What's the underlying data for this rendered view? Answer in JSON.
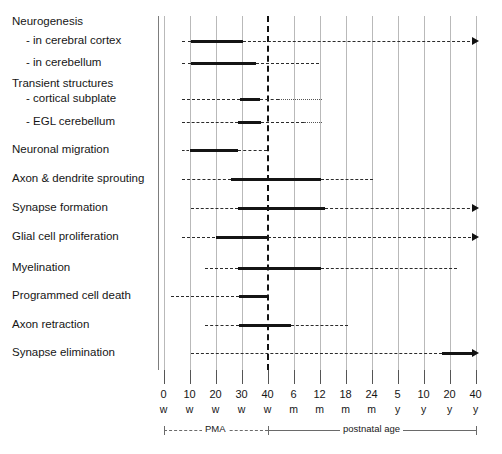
{
  "chart_data": {
    "type": "timeline",
    "title": "",
    "xlabel": "",
    "ylabel": "",
    "grid": true,
    "legend": null,
    "x_tick_numbers": [
      "0",
      "10",
      "20",
      "30",
      "40",
      "6",
      "12",
      "18",
      "24",
      "5",
      "10",
      "20",
      "40"
    ],
    "x_tick_units": [
      "w",
      "w",
      "w",
      "w",
      "w",
      "m",
      "m",
      "m",
      "m",
      "y",
      "y",
      "y",
      "y"
    ],
    "x_index_range": [
      0,
      12
    ],
    "axis_ranges": [
      {
        "label": "PMA",
        "from_index": 0,
        "to_index": 4,
        "style": "dashed"
      },
      {
        "label": "postnatal age",
        "from_index": 4,
        "to_index": 12,
        "style": "solid"
      }
    ],
    "birth_marker_index": 4,
    "categories": [
      "Neurogenesis",
      " -  in cerebral cortex",
      " -   in cerebellum",
      "Transient structures",
      " -  cortical subplate",
      " -  EGL cerebellum",
      "Neuronal migration",
      "Axon & dendrite sprouting",
      "Synapse formation",
      "Glial cell proliferation",
      "Myelination",
      "Programmed cell death",
      "Axon retraction",
      "Synapse elimination"
    ],
    "rows": [
      {
        "label": "Neurogenesis",
        "header": true,
        "segments": []
      },
      {
        "label": " -  in cerebral cortex",
        "header": false,
        "segments": [
          {
            "kind": "dashed",
            "start": 0.72,
            "end": 1.05
          },
          {
            "kind": "solid",
            "start": 1.05,
            "end": 3.05
          },
          {
            "kind": "dashed",
            "start": 3.05,
            "end": 12.0
          }
        ],
        "arrow": true
      },
      {
        "label": " -   in cerebellum",
        "header": false,
        "segments": [
          {
            "kind": "dashed",
            "start": 0.72,
            "end": 1.05
          },
          {
            "kind": "solid",
            "start": 1.05,
            "end": 3.55
          },
          {
            "kind": "dashed",
            "start": 3.55,
            "end": 6.0
          }
        ],
        "arrow": false
      },
      {
        "label": "Transient structures",
        "header": true,
        "segments": []
      },
      {
        "label": " -  cortical subplate",
        "header": false,
        "segments": [
          {
            "kind": "dashed",
            "start": 0.72,
            "end": 2.95
          },
          {
            "kind": "solid",
            "start": 2.95,
            "end": 3.72
          },
          {
            "kind": "dashed",
            "start": 3.72,
            "end": 4.45
          },
          {
            "kind": "dotted",
            "start": 4.45,
            "end": 6.1
          }
        ],
        "arrow": false
      },
      {
        "label": " -  EGL cerebellum",
        "header": false,
        "segments": [
          {
            "kind": "dashed",
            "start": 0.72,
            "end": 2.85
          },
          {
            "kind": "solid",
            "start": 2.85,
            "end": 3.75
          },
          {
            "kind": "dashed",
            "start": 3.75,
            "end": 5.4
          },
          {
            "kind": "dotted",
            "start": 5.4,
            "end": 6.1
          }
        ],
        "arrow": false
      },
      {
        "label": "Neuronal migration",
        "header": false,
        "segments": [
          {
            "kind": "dashed",
            "start": 0.72,
            "end": 1.0
          },
          {
            "kind": "solid",
            "start": 1.0,
            "end": 2.85
          },
          {
            "kind": "dashed",
            "start": 2.85,
            "end": 4.0
          }
        ],
        "arrow": false
      },
      {
        "label": "Axon & dendrite sprouting",
        "header": false,
        "segments": [
          {
            "kind": "dashed",
            "start": 0.72,
            "end": 2.6
          },
          {
            "kind": "solid",
            "start": 2.6,
            "end": 6.05
          },
          {
            "kind": "dashed",
            "start": 6.05,
            "end": 8.05
          }
        ],
        "arrow": false
      },
      {
        "label": "Synapse formation",
        "header": false,
        "segments": [
          {
            "kind": "dashed",
            "start": 1.05,
            "end": 2.85
          },
          {
            "kind": "solid",
            "start": 2.85,
            "end": 6.2
          },
          {
            "kind": "dashed",
            "start": 6.2,
            "end": 12.0
          }
        ],
        "arrow": true
      },
      {
        "label": "Glial cell proliferation",
        "header": false,
        "segments": [
          {
            "kind": "dashed",
            "start": 0.72,
            "end": 2.0
          },
          {
            "kind": "solid",
            "start": 2.0,
            "end": 4.0
          },
          {
            "kind": "dashed",
            "start": 4.0,
            "end": 12.0
          }
        ],
        "arrow": true
      },
      {
        "label": "Myelination",
        "header": false,
        "segments": [
          {
            "kind": "dashed",
            "start": 1.6,
            "end": 2.85
          },
          {
            "kind": "solid",
            "start": 2.85,
            "end": 6.05
          },
          {
            "kind": "dashed",
            "start": 6.05,
            "end": 11.3
          }
        ],
        "arrow": false
      },
      {
        "label": "Programmed cell death",
        "header": false,
        "segments": [
          {
            "kind": "dashed",
            "start": 0.3,
            "end": 2.9
          },
          {
            "kind": "solid",
            "start": 2.9,
            "end": 4.0
          }
        ],
        "arrow": false
      },
      {
        "label": "Axon retraction",
        "header": false,
        "segments": [
          {
            "kind": "dashed",
            "start": 1.6,
            "end": 2.9
          },
          {
            "kind": "solid",
            "start": 2.9,
            "end": 4.9
          },
          {
            "kind": "dashed",
            "start": 4.9,
            "end": 7.1
          }
        ],
        "arrow": false
      },
      {
        "label": "Synapse elimination",
        "header": false,
        "segments": [
          {
            "kind": "dashed",
            "start": 1.05,
            "end": 10.7
          },
          {
            "kind": "solid",
            "start": 10.7,
            "end": 12.0
          }
        ],
        "arrow": true
      }
    ]
  },
  "geometry": {
    "plot_left": 163.5,
    "tick_step": 26.0,
    "axis_top": 16,
    "axis_bottom": 370,
    "row_tops": [
      22,
      41,
      63,
      84,
      99,
      122,
      150,
      179,
      208,
      237,
      268,
      296,
      325,
      353
    ],
    "label_left": 12,
    "label_indent_left": 26
  }
}
